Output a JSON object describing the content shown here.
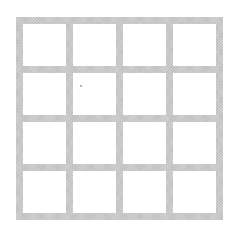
{
  "diagram": {
    "type": "grid",
    "rows": 4,
    "columns": 4,
    "cell_count": 16,
    "line_color": "#c9c9c9",
    "cell_color": "#ffffff",
    "background_color": "#ffffff"
  }
}
